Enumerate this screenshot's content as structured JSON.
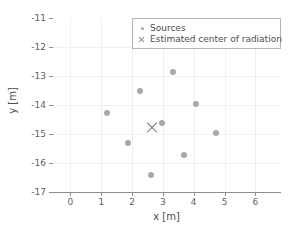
{
  "chart_data": {
    "type": "scatter",
    "title": "",
    "xlabel": "x [m]",
    "ylabel": "y [m]",
    "xlim": [
      -0.6,
      6.8
    ],
    "ylim": [
      -17,
      -11
    ],
    "xticks": [
      0,
      1,
      2,
      3,
      4,
      5,
      6
    ],
    "yticks": [
      -11,
      -12,
      -13,
      -14,
      -15,
      -16,
      -17
    ],
    "xticklabels": [
      "0",
      "1",
      "2",
      "3",
      "4",
      "5",
      "6"
    ],
    "yticklabels": [
      "-11",
      "-12",
      "-13",
      "-14",
      "-15",
      "-16",
      "-17"
    ],
    "grid": true,
    "legend_position": "upper right",
    "series": [
      {
        "name": "Sources",
        "marker": "circle",
        "color": "#a8a8a8",
        "points": [
          {
            "x": 1.18,
            "y": -14.27
          },
          {
            "x": 1.88,
            "y": -15.3
          },
          {
            "x": 2.26,
            "y": -13.51
          },
          {
            "x": 2.62,
            "y": -16.4
          },
          {
            "x": 2.97,
            "y": -14.62
          },
          {
            "x": 3.33,
            "y": -12.85
          },
          {
            "x": 3.67,
            "y": -15.72
          },
          {
            "x": 4.06,
            "y": -13.98
          },
          {
            "x": 4.72,
            "y": -14.97
          }
        ]
      },
      {
        "name": "Estimated center of radiation",
        "marker": "x",
        "color": "#707070",
        "points": [
          {
            "x": 2.65,
            "y": -14.79
          }
        ]
      }
    ]
  },
  "legend": {
    "entries": [
      {
        "label": "Sources",
        "marker": "circle"
      },
      {
        "label": "Estimated center of radiation",
        "marker": "x"
      }
    ]
  },
  "axes": {
    "xlabel": "x [m]",
    "ylabel": "y [m]"
  },
  "colors": {
    "source_marker": "#a8a8a8",
    "center_marker": "#707070",
    "grid": "#f0f0f0",
    "axis": "#8e8e8e",
    "background": "#ffffff"
  }
}
